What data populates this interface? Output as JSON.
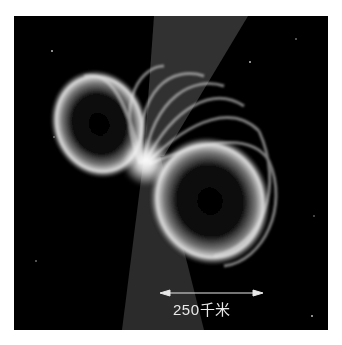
{
  "image": {
    "subject": "pulsar with magnetic field lines and emission beams",
    "background_color": "#000000",
    "page_background": "#ffffff"
  },
  "scale_bar": {
    "label": "250千米",
    "color": "#e8e8e8"
  }
}
